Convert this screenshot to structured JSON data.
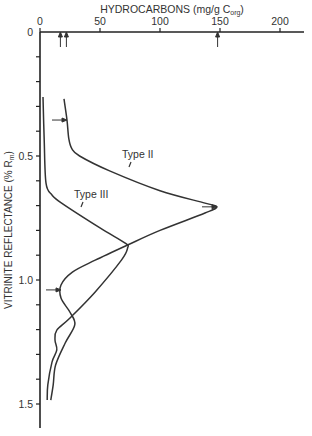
{
  "chart_data": {
    "type": "line",
    "title": "",
    "xlabel": "HYDROCARBONS  (mg/g C",
    "xlabel_sub": "org",
    "xlabel_close": ")",
    "ylabel": "VITRINITE  REFLECTANCE  (% R",
    "ylabel_sub": "m",
    "ylabel_close": ")",
    "x_axis_position": "top",
    "y_axis_inverted": true,
    "xlim": [
      0,
      220
    ],
    "ylim": [
      0,
      1.6
    ],
    "x_ticks": [
      0,
      50,
      100,
      150,
      200
    ],
    "x_tick_labels": [
      "0",
      "50",
      "100",
      "150",
      "200"
    ],
    "y_ticks": [
      0,
      0.5,
      1.0,
      1.5
    ],
    "y_tick_labels": [
      "0",
      "0.5",
      "1.0",
      "1.5"
    ],
    "y_minor_tick_step": 0.1,
    "grid": false,
    "legend": "inline labels",
    "series": [
      {
        "name": "Type II",
        "points": [
          [
            20,
            0.27
          ],
          [
            22.5,
            0.355
          ],
          [
            24,
            0.43
          ],
          [
            26.5,
            0.47
          ],
          [
            33,
            0.5
          ],
          [
            58,
            0.56
          ],
          [
            100,
            0.64
          ],
          [
            137.5,
            0.69
          ],
          [
            147.5,
            0.705
          ],
          [
            137.5,
            0.73
          ],
          [
            100,
            0.8
          ],
          [
            72.5,
            0.86
          ],
          [
            46,
            0.92
          ],
          [
            27,
            0.968
          ],
          [
            17.5,
            1.02
          ],
          [
            17.5,
            1.073
          ],
          [
            25,
            1.13
          ],
          [
            29,
            1.18
          ],
          [
            21,
            1.254
          ],
          [
            13,
            1.343
          ],
          [
            11,
            1.423
          ],
          [
            9,
            1.484
          ]
        ]
      },
      {
        "name": "Type III",
        "points": [
          [
            2.5,
            0.262
          ],
          [
            3.5,
            0.435
          ],
          [
            5,
            0.609
          ],
          [
            10,
            0.657
          ],
          [
            18,
            0.69
          ],
          [
            50,
            0.79
          ],
          [
            71,
            0.851
          ],
          [
            73,
            0.871
          ],
          [
            68,
            0.919
          ],
          [
            46,
            1.048
          ],
          [
            25,
            1.153
          ],
          [
            14,
            1.202
          ],
          [
            12.5,
            1.242
          ],
          [
            14,
            1.282
          ],
          [
            10,
            1.331
          ],
          [
            6.5,
            1.423
          ],
          [
            6,
            1.484
          ]
        ]
      }
    ],
    "annotations": [
      {
        "type": "arrow-up",
        "x": 17,
        "note": "arrow on x-axis"
      },
      {
        "type": "arrow-up",
        "x": 22,
        "note": "arrow on x-axis"
      },
      {
        "type": "arrow-up",
        "x": 148,
        "note": "arrow on x-axis"
      },
      {
        "type": "arrow-right",
        "series": "Type II",
        "y": 0.355
      },
      {
        "type": "arrow-right",
        "series": "Type II",
        "y": 0.705
      },
      {
        "type": "arrow-right",
        "series": "Type II",
        "y": 1.04
      }
    ]
  }
}
